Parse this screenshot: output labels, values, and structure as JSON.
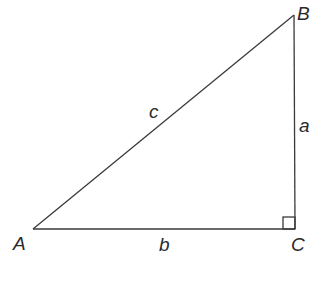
{
  "diagram": {
    "type": "right-triangle",
    "colors": {
      "background": "#ffffff",
      "stroke": "#3a3a3a",
      "text": "#2a2a2a"
    },
    "vertices": [
      {
        "id": "A",
        "label": "A",
        "x": 33,
        "y": 229
      },
      {
        "id": "B",
        "label": "B",
        "x": 294,
        "y": 15
      },
      {
        "id": "C",
        "label": "C",
        "x": 295,
        "y": 229
      }
    ],
    "sides": [
      {
        "id": "a",
        "label": "a",
        "from": "B",
        "to": "C"
      },
      {
        "id": "b",
        "label": "b",
        "from": "A",
        "to": "C"
      },
      {
        "id": "c",
        "label": "c",
        "from": "A",
        "to": "B"
      }
    ],
    "right_angle_at": "C"
  }
}
